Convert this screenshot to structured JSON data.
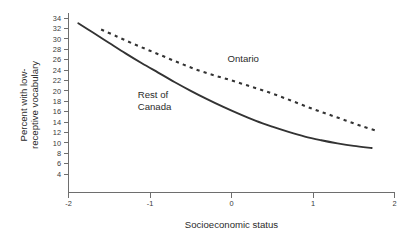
{
  "chart_data": {
    "type": "line",
    "title": "",
    "xlabel": "Socioeconomic status",
    "ylabel_line1": "Percent with low-",
    "ylabel_line2": "receptive vocabulary",
    "xlim": [
      -2,
      2
    ],
    "ylim": [
      3,
      35
    ],
    "grid": false,
    "legend_position": "inline-annotations",
    "x_ticks": [
      "-2",
      "-1",
      "0",
      "1",
      "2"
    ],
    "x_tick_values": [
      -2,
      -1,
      0,
      1,
      2
    ],
    "y_ticks": [
      "4",
      "6",
      "8",
      "10",
      "12",
      "14",
      "16",
      "18",
      "20",
      "22",
      "24",
      "26",
      "28",
      "30",
      "32",
      "34"
    ],
    "y_tick_values": [
      4,
      6,
      8,
      10,
      12,
      14,
      16,
      18,
      20,
      22,
      24,
      26,
      28,
      30,
      32,
      34
    ],
    "series": [
      {
        "name": "Ontario",
        "style": "dashed",
        "color": "#333333",
        "label_x": -0.05,
        "label_y": 25.5,
        "x": [
          -1.6,
          -1.4,
          -1.2,
          -1.0,
          -0.8,
          -0.6,
          -0.4,
          -0.2,
          0.0,
          0.2,
          0.4,
          0.6,
          0.8,
          1.0,
          1.2,
          1.4,
          1.6,
          1.8
        ],
        "values": [
          31.8,
          30.4,
          29.0,
          27.7,
          26.4,
          25.1,
          23.9,
          22.9,
          22.0,
          21.0,
          20.0,
          18.9,
          17.7,
          16.5,
          15.4,
          14.3,
          13.2,
          12.2
        ]
      },
      {
        "name": "Rest of Canada",
        "style": "solid",
        "color": "#333333",
        "label_x": -1.15,
        "label_y": 18.6,
        "x": [
          -1.88,
          -1.7,
          -1.5,
          -1.3,
          -1.1,
          -0.9,
          -0.7,
          -0.5,
          -0.3,
          -0.1,
          0.1,
          0.3,
          0.5,
          0.7,
          0.9,
          1.1,
          1.3,
          1.5,
          1.72
        ],
        "values": [
          33.0,
          31.2,
          29.2,
          27.2,
          25.3,
          23.5,
          21.7,
          20.0,
          18.4,
          16.9,
          15.5,
          14.2,
          13.1,
          12.1,
          11.2,
          10.5,
          9.9,
          9.4,
          9.0
        ]
      }
    ]
  }
}
